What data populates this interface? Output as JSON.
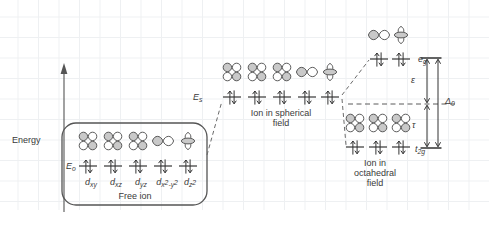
{
  "figure": {
    "axis": {
      "energy_label": "Energy"
    },
    "colors": {
      "grid": "#eceef0",
      "stroke": "#4a4a4a",
      "orbital_fill": "#c9c9c9",
      "text": "#3a3a3a",
      "background": "#ffffff"
    }
  },
  "stages": {
    "free_ion": {
      "caption": "Free ion",
      "energy_label": "E",
      "energy_sub": "o",
      "orbital_labels": [
        {
          "base": "d",
          "sub": "xy"
        },
        {
          "base": "d",
          "sub": "xz"
        },
        {
          "base": "d",
          "sub": "yz"
        },
        {
          "base": "d",
          "sub": "x2-y2"
        },
        {
          "base": "d",
          "sub": "z2"
        }
      ],
      "orbital_shapes": [
        "clover",
        "clover",
        "clover",
        "bowtie",
        "dz2"
      ],
      "electrons_per_level": 2,
      "level_count": 5
    },
    "spherical_field": {
      "caption_line1": "Ion in spherical",
      "caption_line2": "field",
      "energy_label": "E",
      "energy_sub": "s",
      "orbital_shapes": [
        "clover",
        "clover",
        "clover",
        "bowtie",
        "dz2"
      ],
      "electrons_per_level": 2,
      "level_count": 5
    },
    "octahedral_field": {
      "caption_line1": "Ion in",
      "caption_line2": "octahedral",
      "caption_line3": "field",
      "eg": {
        "label": "e",
        "label_sub": "g",
        "orbital_shapes": [
          "bowtie",
          "dz2"
        ],
        "level_count": 2,
        "electrons_per_level": 2
      },
      "t2g": {
        "label": "t",
        "label_sub": "2g",
        "orbital_shapes": [
          "clover",
          "clover",
          "clover"
        ],
        "level_count": 3,
        "electrons_per_level": 2
      }
    }
  },
  "annotations": {
    "epsilon": "ε",
    "tau": "τ",
    "delta": "Δ",
    "delta_sub": "0"
  }
}
